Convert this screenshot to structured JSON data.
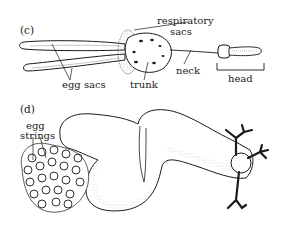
{
  "panels": [
    {
      "id": "c",
      "label": "(c)",
      "annotations": {
        "respiratory": "respiratory",
        "sacs": "sacs",
        "egg_sacs": "egg sacs",
        "trunk": "trunk",
        "neck": "neck",
        "head": "head"
      }
    },
    {
      "id": "d",
      "label": "(d)",
      "annotations": {
        "egg": "egg",
        "strings": "strings"
      }
    }
  ],
  "colors": {
    "ink": "#1a1a1a",
    "background": "#ffffff",
    "stipple": "#9a9a9a"
  }
}
